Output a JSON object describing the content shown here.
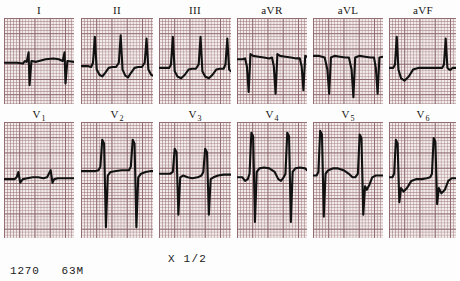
{
  "document": {
    "type": "12-lead electrocardiogram printout",
    "scale_marker": "X 1/2"
  },
  "footer": {
    "record_number": "1270",
    "patient_age_sex": "63M"
  },
  "leads": {
    "limb_row": [
      {
        "key": "I",
        "label": "I",
        "subscript": ""
      },
      {
        "key": "II",
        "label": "II",
        "subscript": ""
      },
      {
        "key": "III",
        "label": "III",
        "subscript": ""
      },
      {
        "key": "aVR",
        "label": "aVR",
        "subscript": ""
      },
      {
        "key": "aVL",
        "label": "aVL",
        "subscript": ""
      },
      {
        "key": "aVF",
        "label": "aVF",
        "subscript": ""
      }
    ],
    "precordial_row": [
      {
        "key": "V1",
        "label": "V",
        "subscript": "1"
      },
      {
        "key": "V2",
        "label": "V",
        "subscript": "2"
      },
      {
        "key": "V3",
        "label": "V",
        "subscript": "3"
      },
      {
        "key": "V4",
        "label": "V",
        "subscript": "4"
      },
      {
        "key": "V5",
        "label": "V",
        "subscript": "5"
      },
      {
        "key": "V6",
        "label": "V",
        "subscript": "6"
      }
    ]
  },
  "chart_data": {
    "type": "line",
    "xlabel": "time",
    "ylabel": "amplitude",
    "grid": true,
    "annotations": [
      "X 1/2",
      "1270",
      "63M"
    ],
    "traces": {
      "I": "M0,52 L14,52 L20,53 L22,50 L24,51 L26,40 L27,78 L29,50 L34,51 L44,48 L52,47 L58,48 L62,50 L64,40 L65,76 L67,50 L74,51",
      "II": "M0,56 L8,56 L11,57 L13,52 L15,22 L17,60 L20,66 L23,68 L26,64 L30,58 L34,57 L38,57 L41,52 L43,20 L45,60 L48,67 L51,69 L54,64 L58,58 L62,57 L66,57 L69,52 L71,24 L73,60 L76,66 L78,67",
      "III": "M0,58 L8,58 L11,58 L13,54 L15,22 L17,62 L20,68 L24,70 L28,66 L32,60 L36,59 L40,59 L43,54 L45,22 L47,62 L50,68 L54,70 L58,66 L62,60 L66,59 L70,59 L72,54 L74,24 L76,60 L78,62",
      "aVR": "M0,48 L6,48 L9,47 L11,56 L13,86 L15,42 L18,44 L24,45 L30,46 L36,47 L39,46 L41,56 L43,88 L45,42 L48,44 L54,45 L60,46 L66,47 L70,47 L72,56 L74,84 L76,44 L78,45",
      "aVL": "M0,44 L6,44 L10,45 L13,46 L16,60 L18,88 L20,46 L24,44 L30,45 L36,46 L40,46 L43,60 L45,92 L47,46 L52,44 L58,45 L64,46 L68,46 L70,58 L72,88 L74,46 L78,45",
      "aVF": "M0,58 L5,58 L7,54 L9,22 L11,60 L14,70 L18,73 L23,68 L28,60 L34,58 L40,58 L44,58 L52,58 L58,58 L62,58 L64,54 L66,24 L68,58 L70,60 L72,60 L74,58 L78,58",
      "V1": "M0,64 L8,64 L12,64 L14,62 L16,56 L18,68 L21,64 L26,63 L32,62 L38,62 L44,63 L48,62 L50,58 L52,54 L54,68 L56,64 L60,63 L66,63 L72,63 L78,63",
      "V2": "M0,55 L10,55 L16,55 L19,54 L21,50 L23,20 L25,24 L27,118 L29,60 L32,56 L38,55 L44,54 L48,54 L52,54 L54,50 L56,20 L58,24 L60,118 L62,62 L65,58 L70,56 L76,55 L78,55",
      "V3": "M0,58 L8,58 L12,58 L15,56 L17,30 L19,34 L21,104 L23,62 L26,60 L31,62 L36,63 L42,62 L46,60 L48,56 L50,30 L52,34 L54,104 L56,64 L59,62 L64,60 L70,59 L76,59 L78,59",
      "V4": "M0,62 L6,62 L9,66 L12,64 L14,58 L16,12 L18,16 L20,112 L22,56 L25,52 L30,51 L36,52 L42,56 L46,64 L49,66 L52,62 L54,58 L56,12 L58,16 L60,112 L62,56 L65,52 L70,51 L76,52 L78,54",
      "V5": "M0,60 L4,60 L6,56 L8,10 L10,14 L12,106 L14,58 L17,54 L22,52 L28,52 L34,54 L40,58 L44,62 L47,62 L50,58 L52,14 L54,18 L56,104 L58,72 L60,76 L63,70 L66,62 L70,60 L74,60 L78,60",
      "V6": "M0,62 L4,62 L6,58 L8,20 L10,24 L12,90 L14,74 L17,78 L21,74 L26,66 L32,64 L38,64 L44,63 L48,62 L50,58 L52,18 L54,22 L56,92 L58,74 L61,80 L65,76 L69,66 L73,63 L78,63"
    }
  }
}
